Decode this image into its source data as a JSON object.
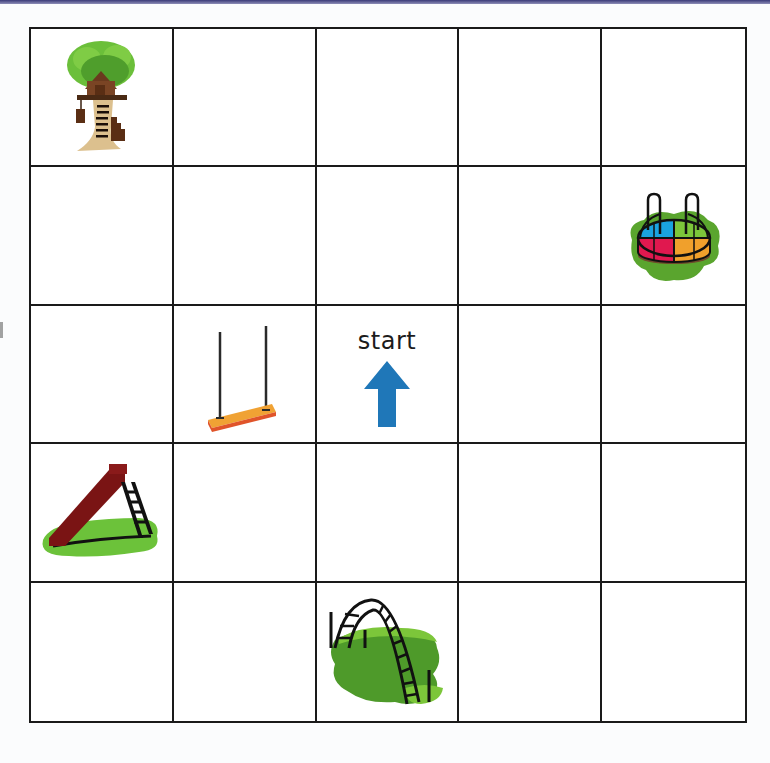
{
  "puzzle": {
    "title": "Playground coding grid",
    "rows": 5,
    "cols": 5,
    "grid_color": "#1a1a1a",
    "start": {
      "label": "start",
      "row": 2,
      "col": 2,
      "direction": "up",
      "arrow_color": "#1f77b8"
    },
    "items": [
      {
        "name": "treehouse",
        "row": 0,
        "col": 0
      },
      {
        "name": "merry-go-round",
        "row": 1,
        "col": 4
      },
      {
        "name": "swing",
        "row": 2,
        "col": 1
      },
      {
        "name": "slide",
        "row": 3,
        "col": 0
      },
      {
        "name": "monkey-bars",
        "row": 4,
        "col": 2
      }
    ]
  }
}
